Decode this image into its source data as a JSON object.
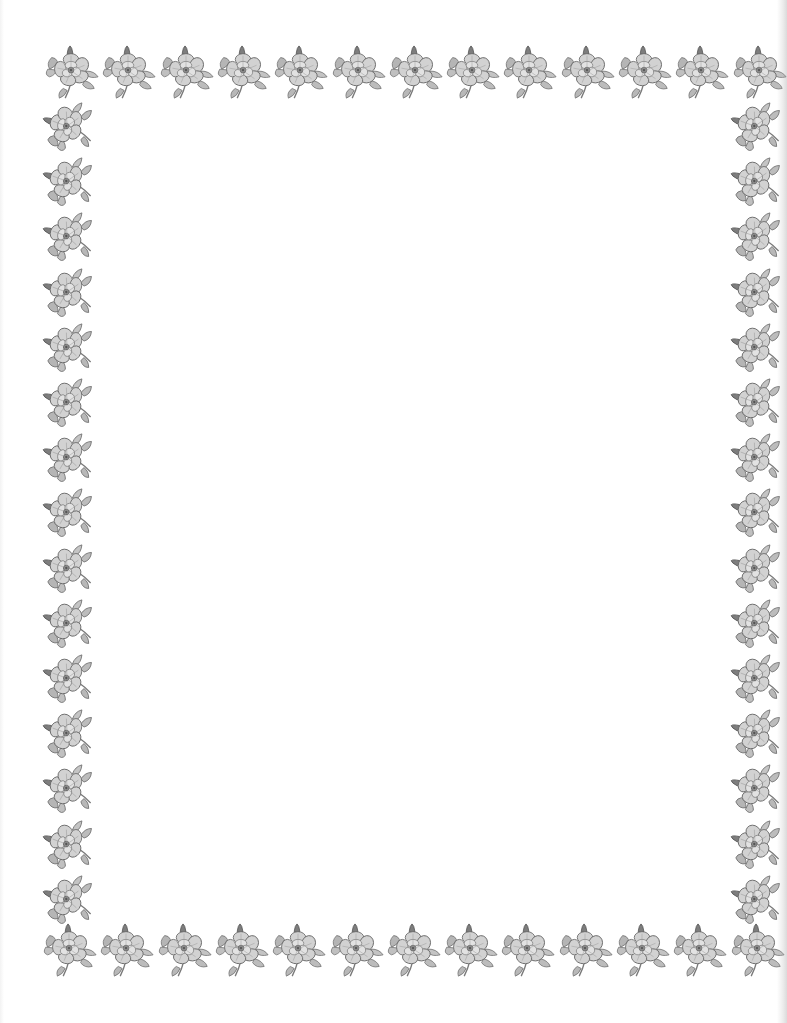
{
  "page": {
    "background": "#ffffff",
    "width": 787,
    "height": 1023
  },
  "border": {
    "motif_icon": "wild-rose-flower-icon",
    "motif_color": "#8a8a8a",
    "motif_stroke_color": "#5e5e5e",
    "top_row": {
      "count": 13,
      "start_x": 42,
      "y": 44,
      "step": 57.3
    },
    "bottom_row": {
      "count": 13,
      "start_x": 40,
      "y": 922,
      "step": 57.3
    },
    "left_column": {
      "count": 15,
      "x": 40,
      "start_y": 98,
      "step": 55.2
    },
    "right_column": {
      "count": 15,
      "x": 728,
      "start_y": 98,
      "step": 55.2
    }
  },
  "content": {
    "text": ""
  }
}
